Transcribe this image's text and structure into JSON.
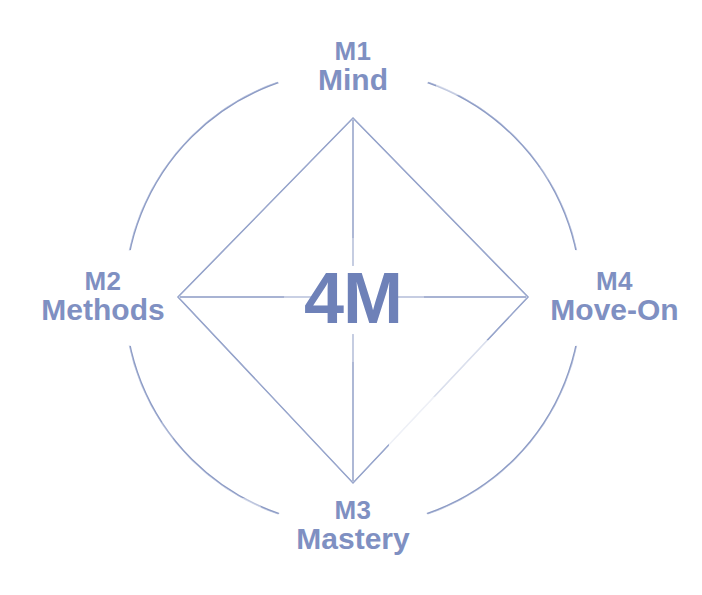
{
  "diagram": {
    "title": "4M",
    "center": {
      "label": "4M",
      "color": "#6e81b8"
    },
    "shape": {
      "outer": "circle",
      "inner": "diamond",
      "line_color": "#8e9cc4",
      "background": "#ffffff"
    },
    "nodes": [
      {
        "id": "m1",
        "code": "M1",
        "name": "Mind",
        "position": "top",
        "color": "#7f90c2"
      },
      {
        "id": "m2",
        "code": "M2",
        "name": "Methods",
        "position": "left",
        "color": "#7f90c2"
      },
      {
        "id": "m3",
        "code": "M3",
        "name": "Mastery",
        "position": "bottom",
        "color": "#7f90c2"
      },
      {
        "id": "m4",
        "code": "M4",
        "name": "Move-On",
        "position": "right",
        "color": "#7f90c2"
      }
    ]
  }
}
